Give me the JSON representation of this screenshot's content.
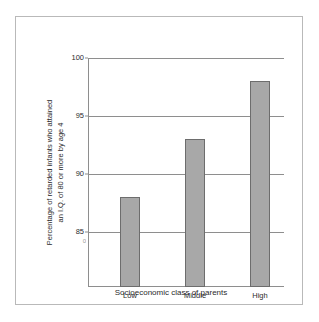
{
  "figure": {
    "background_color": "#ffffff",
    "frame_color": "#b9b9b9",
    "axis_color": "#8e8e8e",
    "bar_fill_color": "#a8a8a8",
    "bar_edge_color": "#6d6d6d",
    "text_color": "#2b2b2b",
    "axis_break_marker": "0"
  },
  "chart_data": {
    "type": "bar",
    "title": "",
    "categories": [
      "Low",
      "Middle",
      "High"
    ],
    "values": [
      88,
      93,
      98
    ],
    "series": [
      {
        "name": "Percentage of retarded infants who attained an I.Q. of 80 or more by age 4",
        "values": [
          88,
          93,
          98
        ]
      }
    ],
    "xlabel": "Socioeconomic class of parents",
    "ylabel": "Percentage of retarded infants who attained an I.Q. of 80 or more by age 4",
    "ylabel_line1": "Percentage of retarded infants who attained",
    "ylabel_line2": "an I.Q. of 80 or more by age 4",
    "ylim": [
      85,
      100
    ],
    "yticks": [
      85,
      90,
      95,
      100
    ],
    "ytick_labels": [
      "85",
      "90",
      "95",
      "100"
    ],
    "grid": true,
    "grid_axis": "y",
    "legend": false,
    "legend_position": "none",
    "axis_broken_below": 85
  }
}
